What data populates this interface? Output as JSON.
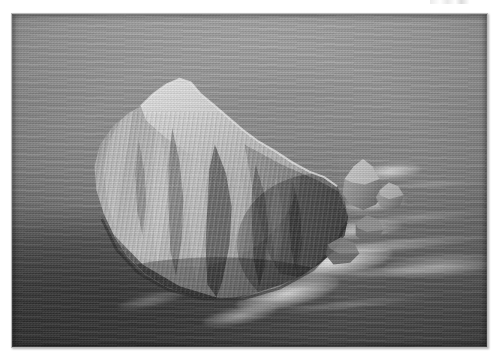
{
  "page": {
    "background_color": "#ffffff",
    "width": 501,
    "height": 360
  },
  "photo": {
    "kind": "photograph",
    "medium": "black-and-white / grayscale aerial photograph",
    "frame": {
      "border_color": "#b9b9b9",
      "shadow": "soft drop shadow to lower-right",
      "left": 11,
      "top": 13,
      "width": 477,
      "height": 335
    },
    "subject": "Large rocky sea stack (island) rising steeply out of the open ocean",
    "description": "Aerial view of a steep pyramidal rock island surrounded by sea. The bright, heavily speckled summit ridge runs from upper-left down to the right, with sheer textured cliff faces cut by deep vertical gullies. A chain of smaller rock outcrops trails away to the right, and white surf breaks around the base of the stack.",
    "composition": {
      "horizon": "no horizon visible; frame is filled entirely by water and rock",
      "viewpoint": "high oblique aerial, looking down onto the stack",
      "light": "bright sunlit summit and left face, deep shadow in the gullies and lower-right cliff"
    },
    "elements": [
      {
        "name": "main-sea-stack",
        "label": "Main rock stack",
        "note": "Occupies the left and centre of the frame; broad sunlit summit, steep fissured flanks"
      },
      {
        "name": "summit-ridge",
        "label": "Summit ridge",
        "note": "Bright, pale, densely speckled crest — characteristic of a seabird colony"
      },
      {
        "name": "cliff-face",
        "label": "Cliff faces",
        "note": "Steep vertical gullies and rock ribs in strong light and shade"
      },
      {
        "name": "outlying-rocks",
        "label": "Outlying rocks",
        "note": "Smaller detached pinnacles and skerries trailing off to the right"
      },
      {
        "name": "surf-wash",
        "label": "Surf and foam",
        "note": "White breaking water encircling the base of the stack and the outlying rocks"
      },
      {
        "name": "open-ocean",
        "label": "Open ocean",
        "note": "Lighter grey water across the top, markedly darker water toward the bottom of the frame"
      }
    ],
    "tones": {
      "sea_upper": "#9d9e9e",
      "sea_lower": "#4a4b4b",
      "rock_highlight": "#d8d6d2",
      "rock_midtone": "#9b9893",
      "rock_shadow": "#3c3b39",
      "surf_white": "#f2f2f0"
    }
  }
}
